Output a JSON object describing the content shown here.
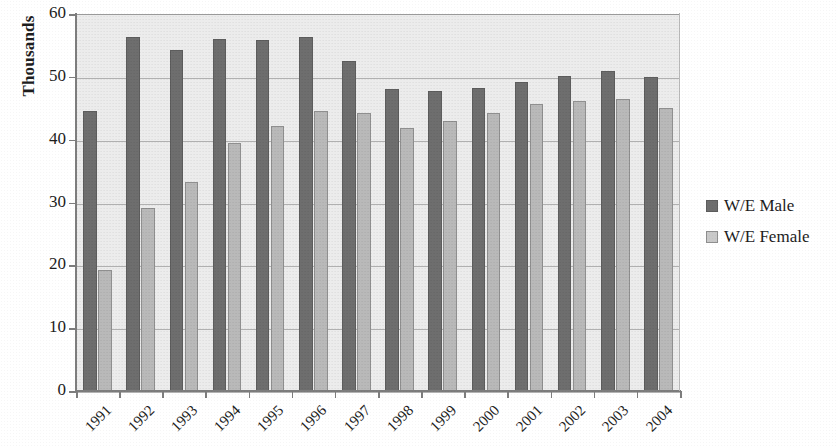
{
  "chart_data": {
    "type": "bar",
    "title": "",
    "subtitle": "",
    "xlabel": "",
    "ylabel": "Thousands",
    "ylim": [
      0,
      60
    ],
    "yticks": [
      0,
      10,
      20,
      30,
      40,
      50,
      60
    ],
    "ytick_labels": [
      "0",
      "10",
      "20",
      "30",
      "40",
      "50",
      "60"
    ],
    "grid": true,
    "legend_position": "right",
    "categories": [
      "1991",
      "1992",
      "1993",
      "1994",
      "1995",
      "1996",
      "1997",
      "1998",
      "1999",
      "2000",
      "2001",
      "2002",
      "2003",
      "2004"
    ],
    "series": [
      {
        "name": "W/E Male",
        "color": "#6e6e6e",
        "values": [
          44.6,
          56.4,
          54.2,
          56.0,
          55.9,
          56.3,
          52.5,
          48.1,
          47.7,
          48.3,
          49.2,
          50.2,
          51.0,
          50.0
        ]
      },
      {
        "name": "W/E Female",
        "color": "#b9b9b9",
        "values": [
          19.2,
          29.1,
          33.3,
          39.5,
          42.2,
          44.6,
          44.2,
          41.8,
          43.0,
          44.2,
          45.6,
          46.2,
          46.4,
          45.1
        ]
      }
    ]
  },
  "legend": {
    "items": [
      {
        "label": "W/E Male",
        "swatch": "male"
      },
      {
        "label": "W/E Female",
        "swatch": "female"
      }
    ]
  },
  "colors": {
    "male_bar": "#6e6e6e",
    "female_bar": "#b9b9b9",
    "plot_background": "#ececec",
    "gridline": "#a6a6a6",
    "axis": "#7d7d7d",
    "text": "#1d1d1d"
  }
}
